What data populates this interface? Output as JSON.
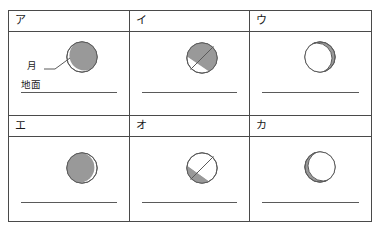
{
  "figure": {
    "type": "moon-phase-choice-grid",
    "colors": {
      "frame": "#4a4a4a",
      "moon_shadow": "#999999",
      "moon_lit": "#ffffff",
      "moon_outline": "#5a5a5a",
      "ground_line": "#5a5a5a",
      "text": "#1a1a1a",
      "page_background": "#ffffff"
    },
    "annotations": {
      "moon_label": "月",
      "ground_label": "地面"
    },
    "panels": [
      {
        "key": "a",
        "label": "ア",
        "moon": {
          "phase_name": "waning-gibbous-shadow-right",
          "shaded_side": "right",
          "lit_fraction": 0.18,
          "shape": "crescent",
          "lit_edge": "lower-left"
        },
        "has_callout": true,
        "has_ground_label": true
      },
      {
        "key": "i",
        "label": "イ",
        "moon": {
          "phase_name": "half-shaded-upper-right",
          "shaded_side": "upper-right",
          "lit_fraction": 0.5,
          "shape": "half-diagonal",
          "split_angle_deg": 45
        },
        "has_callout": false,
        "has_ground_label": false
      },
      {
        "key": "u",
        "label": "ウ",
        "moon": {
          "phase_name": "thin-shadow-right-edge",
          "shaded_side": "right",
          "lit_fraction": 0.82,
          "shape": "crescent",
          "lit_edge": "left"
        },
        "has_callout": false,
        "has_ground_label": false
      },
      {
        "key": "e",
        "label": "エ",
        "moon": {
          "phase_name": "shadow-left-thin-lit-right",
          "shaded_side": "left",
          "lit_fraction": 0.18,
          "shape": "crescent",
          "lit_edge": "right"
        },
        "has_callout": false,
        "has_ground_label": false
      },
      {
        "key": "o",
        "label": "オ",
        "moon": {
          "phase_name": "half-shaded-lower-left",
          "shaded_side": "lower-left",
          "lit_fraction": 0.5,
          "shape": "half-diagonal",
          "split_angle_deg": 45
        },
        "has_callout": false,
        "has_ground_label": false
      },
      {
        "key": "ka",
        "label": "カ",
        "moon": {
          "phase_name": "thin-shadow-left-edge",
          "shaded_side": "left",
          "lit_fraction": 0.82,
          "shape": "crescent",
          "lit_edge": "right"
        },
        "has_callout": false,
        "has_ground_label": false
      }
    ]
  }
}
